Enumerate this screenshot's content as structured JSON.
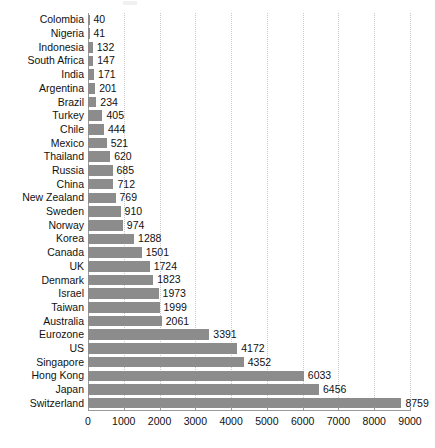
{
  "chart_data": {
    "type": "bar",
    "orientation": "horizontal",
    "title": "",
    "subtitle": "",
    "xlabel": "",
    "ylabel": "",
    "xlim": [
      0,
      9000
    ],
    "xticks": [
      0,
      1000,
      2000,
      3000,
      4000,
      5000,
      6000,
      7000,
      8000,
      9000
    ],
    "xtick_labels": [
      "0",
      "1000",
      "2000",
      "3000",
      "4000",
      "5000",
      "6000",
      "7000",
      "8000",
      "9000"
    ],
    "grid": true,
    "grid_axis": "x",
    "grid_style": "dotted",
    "legend": false,
    "legend_position": "none",
    "bar_color": "#8c8c8c",
    "value_labels": true,
    "categories": [
      "Colombia",
      "Nigeria",
      "Indonesia",
      "South Africa",
      "India",
      "Argentina",
      "Brazil",
      "Turkey",
      "Chile",
      "Mexico",
      "Thailand",
      "Russia",
      "China",
      "New Zealand",
      "Sweden",
      "Norway",
      "Korea",
      "Canada",
      "UK",
      "Denmark",
      "Israel",
      "Taiwan",
      "Australia",
      "Eurozone",
      "US",
      "Singapore",
      "Hong Kong",
      "Japan",
      "Switzerland"
    ],
    "values": [
      40,
      41,
      132,
      147,
      171,
      201,
      234,
      405,
      444,
      521,
      620,
      685,
      712,
      769,
      910,
      974,
      1288,
      1501,
      1724,
      1823,
      1973,
      1999,
      2061,
      3391,
      4172,
      4352,
      6033,
      6456,
      8759
    ],
    "value_label_texts": [
      "40",
      "41",
      "132",
      "147",
      "171",
      "201",
      "234",
      "405",
      "444",
      "521",
      "620",
      "685",
      "712",
      "769",
      "910",
      "974",
      "1288",
      "1501",
      "1724",
      "1823",
      "1973",
      "1999",
      "2061",
      "3391",
      "4172",
      "4352",
      "6033",
      "6456",
      "8759"
    ]
  }
}
